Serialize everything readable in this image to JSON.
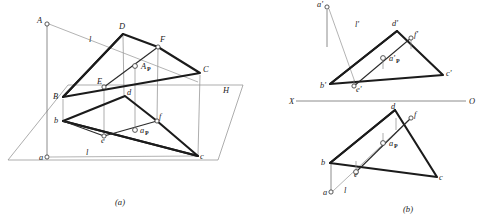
{
  "figure": {
    "title_a": "(a)",
    "title_b": "(b)",
    "width": 478,
    "height": 222,
    "background": "#ffffff",
    "heavy_stroke_color": "#1b1b1b",
    "thin_stroke_color": "#8a8a8a",
    "node_fill": "#ffffff"
  },
  "panel_a": {
    "caption": "(a)",
    "plane_label": "H",
    "line_label_upper": "l",
    "line_label_lower": "l",
    "pierce_label": "A",
    "pierce_sub": "P",
    "pierce_label_lower": "a",
    "pierce_sub_lower": "P",
    "vertices": [
      {
        "name": "A",
        "label": "A",
        "x": 47,
        "y": 24
      },
      {
        "name": "D",
        "label": "D",
        "x": 123,
        "y": 34
      },
      {
        "name": "F",
        "label": "F",
        "x": 158,
        "y": 47
      },
      {
        "name": "C",
        "label": "C",
        "x": 200,
        "y": 73
      },
      {
        "name": "E",
        "label": "E",
        "x": 104,
        "y": 87
      },
      {
        "name": "B",
        "label": "B",
        "x": 63,
        "y": 97
      },
      {
        "name": "d",
        "label": "d",
        "x": 125,
        "y": 96
      },
      {
        "name": "f",
        "label": "f",
        "x": 157,
        "y": 121
      },
      {
        "name": "b",
        "label": "b",
        "x": 63,
        "y": 121
      },
      {
        "name": "e",
        "label": "e",
        "x": 104,
        "y": 136
      },
      {
        "name": "c",
        "label": "c",
        "x": 198,
        "y": 156
      },
      {
        "name": "a",
        "label": "a",
        "x": 47,
        "y": 157
      }
    ]
  },
  "panel_b": {
    "caption": "(b)",
    "axis_left_label": "X",
    "axis_right_label": "O",
    "line_label_upper": "l'",
    "line_label_lower": "l",
    "pierce_label_upper": "a'",
    "pierce_sub_upper": "P",
    "pierce_label_lower": "a",
    "pierce_sub_lower": "P",
    "vertices_front": [
      {
        "name": "a_front",
        "label": "a'",
        "x": 327,
        "y": 7
      },
      {
        "name": "d_front",
        "label": "d'",
        "x": 397,
        "y": 31
      },
      {
        "name": "f_front",
        "label": "f'",
        "x": 411,
        "y": 38
      },
      {
        "name": "c_front",
        "label": "c'",
        "x": 443,
        "y": 75
      },
      {
        "name": "b_front",
        "label": "b'",
        "x": 330,
        "y": 84
      },
      {
        "name": "e_front",
        "label": "e'",
        "x": 354,
        "y": 86
      },
      {
        "name": "ap_front",
        "label": "a'",
        "x": 383,
        "y": 58
      }
    ],
    "vertices_top": [
      {
        "name": "d_top",
        "label": "d",
        "x": 395,
        "y": 110
      },
      {
        "name": "f_top",
        "label": "f",
        "x": 411,
        "y": 118
      },
      {
        "name": "c_top",
        "label": "c",
        "x": 437,
        "y": 177
      },
      {
        "name": "b_top",
        "label": "b",
        "x": 330,
        "y": 163
      },
      {
        "name": "e_top",
        "label": "e",
        "x": 356,
        "y": 172
      },
      {
        "name": "a_top",
        "label": "a",
        "x": 331,
        "y": 192
      },
      {
        "name": "ap_top",
        "label": "a",
        "x": 383,
        "y": 143
      }
    ]
  }
}
